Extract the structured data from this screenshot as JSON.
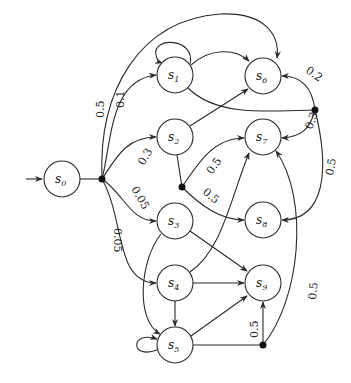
{
  "diagram": {
    "type": "markov-decision-process",
    "initial_state": "s0",
    "nodes": [
      {
        "id": "s0",
        "label": "s",
        "sub": "0",
        "x": 62,
        "y": 179
      },
      {
        "id": "s1",
        "label": "s",
        "sub": "1",
        "x": 175,
        "y": 75
      },
      {
        "id": "s2",
        "label": "s",
        "sub": "2",
        "x": 175,
        "y": 137
      },
      {
        "id": "s3",
        "label": "s",
        "sub": "3",
        "x": 175,
        "y": 221
      },
      {
        "id": "s4",
        "label": "s",
        "sub": "4",
        "x": 175,
        "y": 283
      },
      {
        "id": "s5",
        "label": "s",
        "sub": "5",
        "x": 175,
        "y": 345
      },
      {
        "id": "s6",
        "label": "s",
        "sub": "6",
        "x": 263,
        "y": 76
      },
      {
        "id": "s7",
        "label": "s",
        "sub": "7",
        "x": 263,
        "y": 137
      },
      {
        "id": "s8",
        "label": "s",
        "sub": "8",
        "x": 263,
        "y": 220
      },
      {
        "id": "s9",
        "label": "s",
        "sub": "9",
        "x": 263,
        "y": 283
      }
    ],
    "branch_points": [
      {
        "id": "b0",
        "x": 102,
        "y": 179,
        "from": "s0"
      },
      {
        "id": "b1",
        "x": 315,
        "y": 110,
        "from": "s1"
      },
      {
        "id": "b2",
        "x": 182,
        "y": 187,
        "from": "s2"
      },
      {
        "id": "b3",
        "x": 263,
        "y": 345,
        "from": "s5"
      }
    ],
    "edges": [
      {
        "from": "b0",
        "to": "s6",
        "prob": "0.5"
      },
      {
        "from": "b0",
        "to": "s1",
        "prob": "0.1"
      },
      {
        "from": "b0",
        "to": "s2",
        "prob": "0.3"
      },
      {
        "from": "b0",
        "to": "s3",
        "prob": "0.05"
      },
      {
        "from": "b0",
        "to": "s4",
        "prob": "0.05"
      },
      {
        "from": "s1",
        "to": "s1",
        "prob": ""
      },
      {
        "from": "s1",
        "to": "s6",
        "prob": ""
      },
      {
        "from": "b1",
        "to": "s6",
        "prob": "0.2"
      },
      {
        "from": "b1",
        "to": "s7",
        "prob": "0.3"
      },
      {
        "from": "b1",
        "to": "s8",
        "prob": "0.5"
      },
      {
        "from": "s2",
        "to": "s6",
        "prob": ""
      },
      {
        "from": "b2",
        "to": "s7",
        "prob": "0.5"
      },
      {
        "from": "b2",
        "to": "s8",
        "prob": "0.5"
      },
      {
        "from": "s3",
        "to": "s9",
        "prob": ""
      },
      {
        "from": "s3",
        "to": "s5",
        "prob": ""
      },
      {
        "from": "s4",
        "to": "s7",
        "prob": ""
      },
      {
        "from": "s4",
        "to": "s9",
        "prob": ""
      },
      {
        "from": "s4",
        "to": "s5",
        "prob": ""
      },
      {
        "from": "s5",
        "to": "s5",
        "prob": ""
      },
      {
        "from": "s5",
        "to": "s9",
        "prob": ""
      },
      {
        "from": "b3",
        "to": "s9",
        "prob": "0.5"
      },
      {
        "from": "b3",
        "to": "s7",
        "prob": "0.5"
      }
    ],
    "labels": {
      "b0_s6": "0.5",
      "b0_s1": "0.1",
      "b0_s2": "0.3",
      "b0_s3": "0.05",
      "b0_s4": "0.05",
      "b1_s6": "0.2",
      "b1_s7": "0.3",
      "b1_s8": "0.5",
      "b2_s7": "0.5",
      "b2_s8": "0.5",
      "b3_s9": "0.5",
      "b3_s7": "0.5"
    }
  }
}
